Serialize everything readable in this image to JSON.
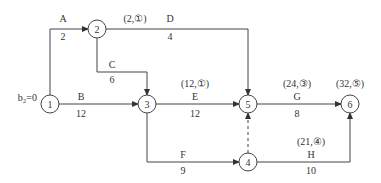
{
  "diagram": {
    "type": "activity-on-arrow network",
    "start_label": "b₂=0",
    "nodes": [
      {
        "id": "1",
        "label": "1",
        "x": 50,
        "y": 104
      },
      {
        "id": "2",
        "label": "2",
        "x": 97,
        "y": 29
      },
      {
        "id": "3",
        "label": "3",
        "x": 147,
        "y": 104
      },
      {
        "id": "4",
        "label": "4",
        "x": 248,
        "y": 162
      },
      {
        "id": "5",
        "label": "5",
        "x": 248,
        "y": 104
      },
      {
        "id": "6",
        "label": "6",
        "x": 350,
        "y": 104
      }
    ],
    "activities": [
      {
        "name": "A",
        "duration": "2",
        "from": "1",
        "to": "2",
        "annotation": ""
      },
      {
        "name": "B",
        "duration": "12",
        "from": "1",
        "to": "3",
        "annotation": ""
      },
      {
        "name": "C",
        "duration": "6",
        "from": "2",
        "to": "3",
        "annotation": ""
      },
      {
        "name": "D",
        "duration": "4",
        "from": "2",
        "to": "5",
        "annotation": "(2,①)"
      },
      {
        "name": "E",
        "duration": "12",
        "from": "3",
        "to": "5",
        "annotation": "(12,①)"
      },
      {
        "name": "F",
        "duration": "9",
        "from": "3",
        "to": "4",
        "annotation": ""
      },
      {
        "name": "G",
        "duration": "8",
        "from": "5",
        "to": "6",
        "annotation": "(24,③)"
      },
      {
        "name": "H",
        "duration": "10",
        "from": "4",
        "to": "6",
        "annotation": "(21,④)"
      },
      {
        "name": "dummy",
        "duration": "",
        "from": "4",
        "to": "5",
        "annotation": "",
        "dashed": true
      }
    ],
    "node6_annotation": "(32,⑤)"
  }
}
